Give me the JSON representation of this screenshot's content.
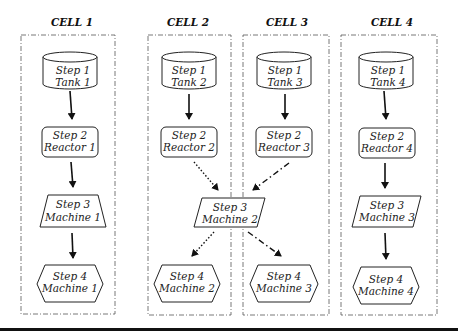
{
  "cells": [
    {
      "title": "CELL 1"
    },
    {
      "title": "CELL 2"
    },
    {
      "title": "CELL 3"
    },
    {
      "title": "CELL 4"
    }
  ],
  "nodes": {
    "tank1": {
      "step": "Step 1",
      "name": "Tank 1",
      "type": "cylinder"
    },
    "tank2": {
      "step": "Step 1",
      "name": "Tank 2",
      "type": "cylinder"
    },
    "tank3": {
      "step": "Step 1",
      "name": "Tank 3",
      "type": "cylinder"
    },
    "tank4": {
      "step": "Step 1",
      "name": "Tank 4",
      "type": "cylinder"
    },
    "reactor1": {
      "step": "Step 2",
      "name": "Reactor 1",
      "type": "rounded-rect"
    },
    "reactor2": {
      "step": "Step 2",
      "name": "Reactor 2",
      "type": "rounded-rect"
    },
    "reactor3": {
      "step": "Step 2",
      "name": "Reactor 3",
      "type": "rounded-rect"
    },
    "reactor4": {
      "step": "Step 2",
      "name": "Reactor 4",
      "type": "rounded-rect"
    },
    "machine1_s3": {
      "step": "Step 3",
      "name": "Machine 1",
      "type": "parallelogram"
    },
    "machine2_s3": {
      "step": "Step 3",
      "name": "Machine 2",
      "type": "parallelogram"
    },
    "machine3_s3": {
      "step": "Step 3",
      "name": "Machine 3",
      "type": "parallelogram"
    },
    "machine1_s4": {
      "step": "Step 4",
      "name": "Machine 1",
      "type": "hexagon"
    },
    "machine2_s4": {
      "step": "Step 4",
      "name": "Machine 2",
      "type": "hexagon"
    },
    "machine3_s4": {
      "step": "Step 4",
      "name": "Machine 3",
      "type": "hexagon"
    },
    "machine4_s4": {
      "step": "Step 4",
      "name": "Machine 4",
      "type": "hexagon"
    }
  },
  "edges": [
    {
      "from": "tank1",
      "to": "reactor1",
      "style": "solid"
    },
    {
      "from": "reactor1",
      "to": "machine1_s3",
      "style": "solid"
    },
    {
      "from": "machine1_s3",
      "to": "machine1_s4",
      "style": "solid"
    },
    {
      "from": "tank2",
      "to": "reactor2",
      "style": "solid"
    },
    {
      "from": "reactor2",
      "to": "machine2_s3",
      "style": "dotted"
    },
    {
      "from": "machine2_s3",
      "to": "machine2_s4",
      "style": "dotted"
    },
    {
      "from": "tank3",
      "to": "reactor3",
      "style": "solid"
    },
    {
      "from": "reactor3",
      "to": "machine2_s3",
      "style": "dash-dot"
    },
    {
      "from": "machine2_s3",
      "to": "machine3_s4",
      "style": "dash-dot"
    },
    {
      "from": "tank4",
      "to": "reactor4",
      "style": "solid"
    },
    {
      "from": "reactor4",
      "to": "machine3_s3",
      "style": "solid"
    },
    {
      "from": "machine3_s3",
      "to": "machine4_s4",
      "style": "solid"
    }
  ]
}
